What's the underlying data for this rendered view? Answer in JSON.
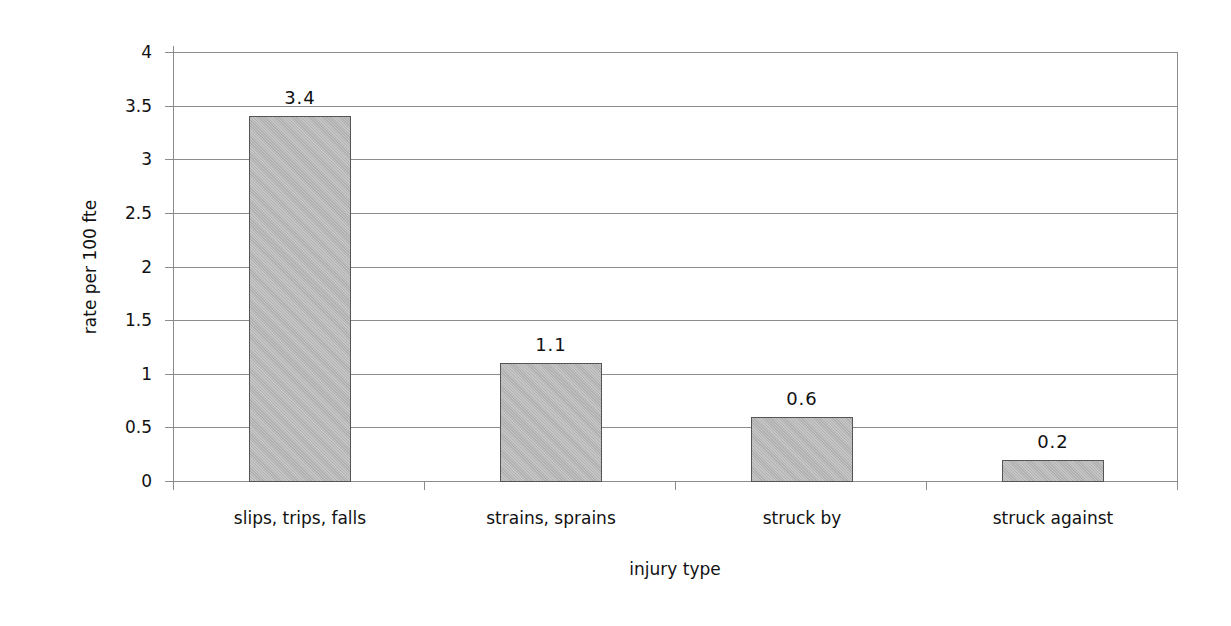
{
  "chart_data": {
    "type": "bar",
    "title": "",
    "xlabel": "injury type",
    "ylabel": "rate per 100 fte",
    "categories": [
      "slips, trips, falls",
      "strains, sprains",
      "struck by",
      "struck against"
    ],
    "values": [
      3.4,
      1.1,
      0.6,
      0.2
    ],
    "value_labels": [
      "3.4",
      "1.1",
      "0.6",
      "0.2"
    ],
    "ylim": [
      0,
      4
    ],
    "yticks": [
      0,
      0.5,
      1,
      1.5,
      2,
      2.5,
      3,
      3.5,
      4
    ],
    "ytick_labels": [
      "0",
      "0.5",
      "1",
      "1.5",
      "2",
      "2.5",
      "3",
      "3.5",
      "4"
    ],
    "grid": true,
    "legend": "none",
    "colors": {
      "bar_fill": "#b9b9b9",
      "bar_border": "#555555",
      "gridline": "#8c8c8c"
    }
  }
}
